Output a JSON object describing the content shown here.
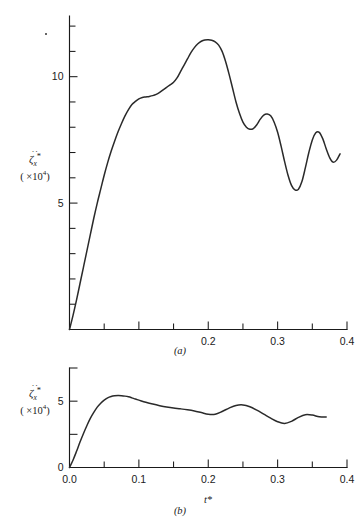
{
  "figure": {
    "stray_mark": "·",
    "panels": [
      {
        "id": "a",
        "panel_label": "(a)",
        "ylabel_symbol": "ζ",
        "ylabel_dots": "··",
        "ylabel_sub": "x",
        "ylabel_star": "*",
        "ylabel_scale_open": "( ×10",
        "ylabel_scale_exp": "4",
        "ylabel_scale_close": ")",
        "xlabel": "",
        "x_tick_labels": [
          "",
          "",
          "",
          "",
          "0.2",
          "0.3",
          "0.4"
        ],
        "y_tick_labels": [
          "5",
          "10"
        ]
      },
      {
        "id": "b",
        "panel_label": "(b)",
        "ylabel_symbol": "ζ",
        "ylabel_dots": "··",
        "ylabel_sub": "x",
        "ylabel_star": "*",
        "ylabel_scale_open": "( ×10",
        "ylabel_scale_exp": "4",
        "ylabel_scale_close": ")",
        "xlabel": "t*",
        "x_tick_labels": [
          "0.0",
          "0.1",
          "0.2",
          "0.3",
          "0.4"
        ],
        "y_tick_labels": [
          "0",
          "5"
        ]
      }
    ]
  },
  "chart_data": [
    {
      "type": "line",
      "panel": "(a)",
      "title": "",
      "xlabel": "",
      "ylabel": "zeta-ddot-x* (x10^4)",
      "xlim": [
        0.0,
        0.4
      ],
      "ylim": [
        0.0,
        12.4
      ],
      "xticks": [
        0.0,
        0.05,
        0.1,
        0.15,
        0.2,
        0.25,
        0.3,
        0.35,
        0.4
      ],
      "xticklabels": [
        "",
        "",
        "",
        "",
        "0.2",
        "0.3",
        "0.4"
      ],
      "yticks": [
        0,
        1,
        2,
        3,
        4,
        5,
        6,
        7,
        8,
        9,
        10,
        11,
        12
      ],
      "yticklabels": [
        "5",
        "10"
      ],
      "grid": false,
      "legend": "none",
      "series": [
        {
          "name": "zeta_ddot_x",
          "x": [
            0.0,
            0.005,
            0.01,
            0.015,
            0.02,
            0.025,
            0.03,
            0.035,
            0.04,
            0.045,
            0.05,
            0.055,
            0.06,
            0.065,
            0.07,
            0.075,
            0.08,
            0.085,
            0.09,
            0.095,
            0.1,
            0.105,
            0.11,
            0.115,
            0.12,
            0.125,
            0.13,
            0.135,
            0.14,
            0.145,
            0.15,
            0.155,
            0.16,
            0.165,
            0.17,
            0.175,
            0.18,
            0.185,
            0.19,
            0.195,
            0.2,
            0.205,
            0.21,
            0.215,
            0.22,
            0.225,
            0.23,
            0.235,
            0.24,
            0.245,
            0.25,
            0.255,
            0.26,
            0.265,
            0.27,
            0.275,
            0.28,
            0.285,
            0.29,
            0.295,
            0.3,
            0.305,
            0.31,
            0.315,
            0.32,
            0.325,
            0.33,
            0.335,
            0.34,
            0.345,
            0.35,
            0.355,
            0.36,
            0.365,
            0.37,
            0.375,
            0.38,
            0.385,
            0.39
          ],
          "y": [
            0.0,
            0.55,
            1.15,
            1.8,
            2.45,
            3.1,
            3.75,
            4.4,
            5.0,
            5.55,
            6.1,
            6.6,
            7.05,
            7.45,
            7.82,
            8.15,
            8.45,
            8.7,
            8.9,
            9.02,
            9.12,
            9.18,
            9.2,
            9.22,
            9.25,
            9.3,
            9.38,
            9.48,
            9.58,
            9.68,
            9.78,
            9.95,
            10.2,
            10.45,
            10.7,
            10.95,
            11.15,
            11.3,
            11.4,
            11.45,
            11.46,
            11.44,
            11.38,
            11.25,
            11.0,
            10.6,
            10.1,
            9.55,
            9.0,
            8.55,
            8.2,
            8.0,
            7.92,
            7.95,
            8.1,
            8.32,
            8.48,
            8.52,
            8.45,
            8.2,
            7.8,
            7.25,
            6.65,
            6.1,
            5.7,
            5.52,
            5.55,
            5.85,
            6.4,
            7.0,
            7.5,
            7.78,
            7.8,
            7.55,
            7.15,
            6.8,
            6.62,
            6.7,
            6.95
          ]
        }
      ]
    },
    {
      "type": "line",
      "panel": "(b)",
      "title": "",
      "xlabel": "t*",
      "ylabel": "zeta-ddot-x* (x10^4)",
      "xlim": [
        0.0,
        0.4
      ],
      "ylim": [
        0.0,
        7.5
      ],
      "xticks": [
        0.0,
        0.05,
        0.1,
        0.15,
        0.2,
        0.25,
        0.3,
        0.35,
        0.4
      ],
      "xticklabels": [
        "0.0",
        "",
        "0.1",
        "",
        "0.2",
        "",
        "0.3",
        "",
        "0.4"
      ],
      "yticks": [
        0,
        2.5,
        5.0,
        7.5
      ],
      "yticklabels": [
        "0",
        "5"
      ],
      "grid": false,
      "legend": "none",
      "series": [
        {
          "name": "zeta_ddot_x",
          "x": [
            0.0,
            0.005,
            0.01,
            0.015,
            0.02,
            0.025,
            0.03,
            0.035,
            0.04,
            0.045,
            0.05,
            0.055,
            0.06,
            0.065,
            0.07,
            0.075,
            0.08,
            0.085,
            0.09,
            0.095,
            0.1,
            0.11,
            0.12,
            0.13,
            0.14,
            0.15,
            0.16,
            0.17,
            0.18,
            0.19,
            0.2,
            0.21,
            0.22,
            0.23,
            0.24,
            0.25,
            0.26,
            0.27,
            0.28,
            0.29,
            0.3,
            0.31,
            0.32,
            0.33,
            0.34,
            0.35,
            0.36,
            0.37
          ],
          "y": [
            0.0,
            0.55,
            1.2,
            1.9,
            2.55,
            3.15,
            3.7,
            4.15,
            4.55,
            4.85,
            5.08,
            5.25,
            5.35,
            5.4,
            5.42,
            5.41,
            5.38,
            5.33,
            5.25,
            5.16,
            5.08,
            4.92,
            4.78,
            4.66,
            4.56,
            4.48,
            4.42,
            4.35,
            4.26,
            4.14,
            4.02,
            4.02,
            4.22,
            4.48,
            4.68,
            4.72,
            4.58,
            4.32,
            4.02,
            3.72,
            3.45,
            3.32,
            3.48,
            3.78,
            3.98,
            3.95,
            3.82,
            3.8
          ]
        }
      ]
    }
  ]
}
